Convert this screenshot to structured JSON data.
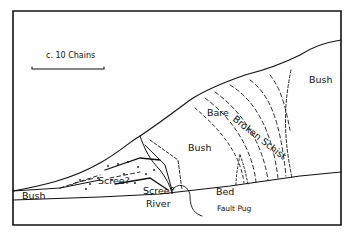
{
  "figure": {
    "type": "geological sketch map",
    "scale_label": "c. 10 Chains",
    "labels": {
      "bush_top_right": "Bush",
      "bush_center": "Bush",
      "bush_left": "Bush",
      "bare": "Bare",
      "broken_schist": "Broken Schist",
      "scree_1": "Scree?",
      "scree_2": "Scree?",
      "river": "River",
      "bed": "Bed",
      "fault_pug": "Fault Pug"
    }
  },
  "colors": {
    "ink": "#111111",
    "paper": "#ffffff"
  }
}
